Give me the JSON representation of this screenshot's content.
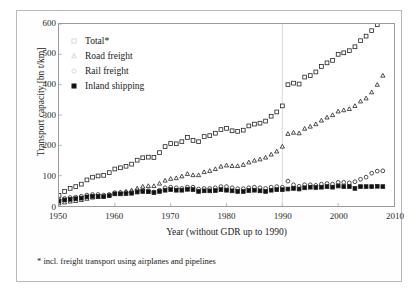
{
  "chart_data": {
    "type": "scatter",
    "title": "",
    "xlabel": "Year (without GDR up to 1990)",
    "ylabel": "Transport capacity [bn t/km]",
    "xlim": [
      1950,
      2010
    ],
    "ylim": [
      0,
      600
    ],
    "xticks": [
      1950,
      1960,
      1970,
      1980,
      1990,
      2000,
      2010
    ],
    "yticks": [
      0,
      100,
      200,
      300,
      400,
      500,
      600
    ],
    "grid": false,
    "legend_position": "top-left",
    "footnote": "* incl. freight transport using airplanes and pipelines",
    "break_year": 1990,
    "series": [
      {
        "name": "Total*",
        "marker": "open-square",
        "x": [
          1950,
          1951,
          1952,
          1953,
          1954,
          1955,
          1956,
          1957,
          1958,
          1959,
          1960,
          1961,
          1962,
          1963,
          1964,
          1965,
          1966,
          1967,
          1968,
          1969,
          1970,
          1971,
          1972,
          1973,
          1974,
          1975,
          1976,
          1977,
          1978,
          1979,
          1980,
          1981,
          1982,
          1983,
          1984,
          1985,
          1986,
          1987,
          1988,
          1989,
          1990,
          1991,
          1992,
          1993,
          1994,
          1995,
          1996,
          1997,
          1998,
          1999,
          2000,
          2001,
          2002,
          2003,
          2004,
          2005,
          2006,
          2007,
          2008
        ],
        "y": [
          35,
          48,
          58,
          64,
          72,
          86,
          95,
          99,
          101,
          110,
          122,
          126,
          131,
          138,
          151,
          159,
          161,
          160,
          176,
          196,
          206,
          205,
          212,
          226,
          216,
          212,
          229,
          232,
          240,
          252,
          256,
          248,
          246,
          250,
          264,
          270,
          273,
          280,
          296,
          310,
          330,
          400,
          405,
          402,
          425,
          430,
          442,
          460,
          472,
          480,
          500,
          505,
          512,
          525,
          545,
          560,
          578,
          598,
          610
        ]
      },
      {
        "name": "Road freight",
        "marker": "open-triangle",
        "x": [
          1950,
          1951,
          1952,
          1953,
          1954,
          1955,
          1956,
          1957,
          1958,
          1959,
          1960,
          1961,
          1962,
          1963,
          1964,
          1965,
          1966,
          1967,
          1968,
          1969,
          1970,
          1971,
          1972,
          1973,
          1974,
          1975,
          1976,
          1977,
          1978,
          1979,
          1980,
          1981,
          1982,
          1983,
          1984,
          1985,
          1986,
          1987,
          1988,
          1989,
          1990,
          1991,
          1992,
          1993,
          1994,
          1995,
          1996,
          1997,
          1998,
          1999,
          2000,
          2001,
          2002,
          2003,
          2004,
          2005,
          2006,
          2007,
          2008
        ],
        "y": [
          9,
          12,
          15,
          17,
          20,
          24,
          28,
          30,
          32,
          36,
          42,
          45,
          48,
          52,
          58,
          64,
          66,
          66,
          74,
          84,
          90,
          92,
          98,
          106,
          102,
          102,
          112,
          116,
          122,
          130,
          134,
          132,
          132,
          136,
          144,
          150,
          154,
          160,
          170,
          180,
          196,
          238,
          242,
          240,
          255,
          262,
          270,
          282,
          292,
          300,
          312,
          316,
          320,
          330,
          345,
          355,
          375,
          400,
          430
        ]
      },
      {
        "name": "Rail freight",
        "marker": "open-circle",
        "x": [
          1950,
          1951,
          1952,
          1953,
          1954,
          1955,
          1956,
          1957,
          1958,
          1959,
          1960,
          1961,
          1962,
          1963,
          1964,
          1965,
          1966,
          1967,
          1968,
          1969,
          1970,
          1971,
          1972,
          1973,
          1974,
          1975,
          1976,
          1977,
          1978,
          1979,
          1980,
          1981,
          1982,
          1983,
          1984,
          1985,
          1986,
          1987,
          1988,
          1989,
          1990,
          1991,
          1992,
          1993,
          1994,
          1995,
          1996,
          1997,
          1998,
          1999,
          2000,
          2001,
          2002,
          2003,
          2004,
          2005,
          2006,
          2007,
          2008
        ],
        "y": [
          20,
          25,
          28,
          29,
          32,
          36,
          38,
          38,
          36,
          38,
          44,
          44,
          45,
          46,
          50,
          52,
          50,
          46,
          52,
          60,
          62,
          60,
          58,
          62,
          62,
          56,
          58,
          58,
          60,
          64,
          64,
          60,
          57,
          57,
          60,
          62,
          60,
          58,
          62,
          64,
          62,
          82,
          70,
          65,
          70,
          70,
          68,
          72,
          74,
          72,
          78,
          78,
          76,
          80,
          88,
          95,
          108,
          115,
          116
        ]
      },
      {
        "name": "Inland shipping",
        "marker": "filled-square",
        "x": [
          1950,
          1951,
          1952,
          1953,
          1954,
          1955,
          1956,
          1957,
          1958,
          1959,
          1960,
          1961,
          1962,
          1963,
          1964,
          1965,
          1966,
          1967,
          1968,
          1969,
          1970,
          1971,
          1972,
          1973,
          1974,
          1975,
          1976,
          1977,
          1978,
          1979,
          1980,
          1981,
          1982,
          1983,
          1984,
          1985,
          1986,
          1987,
          1988,
          1989,
          1990,
          1991,
          1992,
          1993,
          1994,
          1995,
          1996,
          1997,
          1998,
          1999,
          2000,
          2001,
          2002,
          2003,
          2004,
          2005,
          2006,
          2007,
          2008
        ],
        "y": [
          16,
          20,
          22,
          24,
          26,
          30,
          32,
          32,
          31,
          34,
          40,
          40,
          41,
          42,
          46,
          48,
          47,
          44,
          48,
          52,
          54,
          52,
          52,
          55,
          54,
          48,
          50,
          50,
          51,
          54,
          52,
          50,
          48,
          48,
          51,
          52,
          50,
          48,
          52,
          54,
          54,
          56,
          58,
          56,
          60,
          62,
          61,
          62,
          64,
          62,
          66,
          64,
          64,
          58,
          64,
          64,
          64,
          65,
          64
        ]
      }
    ]
  },
  "legend": {
    "items": [
      {
        "label": "Total*",
        "marker": "open-square"
      },
      {
        "label": "Road freight",
        "marker": "open-triangle"
      },
      {
        "label": "Rail freight",
        "marker": "open-circle"
      },
      {
        "label": "Inland shipping",
        "marker": "filled-square"
      }
    ]
  }
}
